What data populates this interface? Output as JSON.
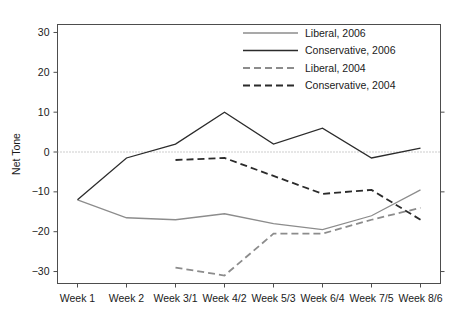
{
  "chart_data": {
    "type": "line",
    "title": "",
    "xlabel": "",
    "ylabel": "Net Tone",
    "categories": [
      "Week 1",
      "Week 2",
      "Week 3/1",
      "Week 4/2",
      "Week 5/3",
      "Week 6/4",
      "Week 7/5",
      "Week 8/6"
    ],
    "ylim": [
      -33,
      32
    ],
    "yticks": [
      30,
      20,
      10,
      0,
      -10,
      -20,
      -30
    ],
    "ytick_labels": [
      "30",
      "20",
      "10",
      "0",
      "−10",
      "−20",
      "−30"
    ],
    "grid": false,
    "zero_reference_line": true,
    "legend_position": "top-right",
    "series": [
      {
        "name": "Liberal, 2006",
        "color": "#8c8c8c",
        "style": "solid",
        "x": [
          "Week 1",
          "Week 2",
          "Week 3/1",
          "Week 4/2",
          "Week 5/3",
          "Week 6/4",
          "Week 7/5",
          "Week 8/6"
        ],
        "values": [
          -12,
          -16.5,
          -17,
          -15.5,
          -18,
          -19.5,
          -16,
          -9.5
        ]
      },
      {
        "name": "Conservative, 2006",
        "color": "#2b2b2b",
        "style": "solid",
        "x": [
          "Week 1",
          "Week 2",
          "Week 3/1",
          "Week 4/2",
          "Week 5/3",
          "Week 6/4",
          "Week 7/5",
          "Week 8/6"
        ],
        "values": [
          -12,
          -1.5,
          2,
          10,
          2,
          6,
          -1.5,
          1
        ]
      },
      {
        "name": "Liberal, 2004",
        "color": "#8c8c8c",
        "style": "dashed",
        "x": [
          "Week 3/1",
          "Week 4/2",
          "Week 5/3",
          "Week 6/4",
          "Week 7/5",
          "Week 8/6"
        ],
        "values": [
          -29,
          -31,
          -20.5,
          -20.5,
          -17,
          -14
        ]
      },
      {
        "name": "Conservative, 2004",
        "color": "#2b2b2b",
        "style": "dashed",
        "x": [
          "Week 3/1",
          "Week 4/2",
          "Week 5/3",
          "Week 6/4",
          "Week 7/5",
          "Week 8/6"
        ],
        "values": [
          -2,
          -1.5,
          -6,
          -10.5,
          -9.5,
          -17
        ]
      }
    ]
  },
  "legend": {
    "items": [
      {
        "label": "Liberal, 2006"
      },
      {
        "label": "Conservative, 2006"
      },
      {
        "label": "Liberal, 2004"
      },
      {
        "label": "Conservative, 2004"
      }
    ]
  }
}
